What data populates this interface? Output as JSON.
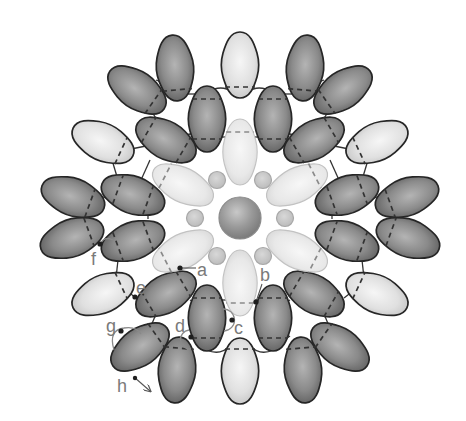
{
  "diagram": {
    "type": "beadwork-pattern",
    "labels": {
      "a": "a",
      "b": "b",
      "c": "c",
      "d": "d",
      "e": "e",
      "f": "f",
      "g": "g",
      "h": "h"
    },
    "colors": {
      "dark_bead_highlight": "#b4b4b4",
      "dark_bead_mid": "#8a8a8a",
      "dark_bead_edge": "#5e5e5e",
      "light_bead_highlight": "#f4f4f4",
      "light_bead_edge": "#c8c8c8",
      "petal_highlight": "#f5f5f5",
      "petal_edge": "#d8d8d8",
      "petal_outline": "#c2c2c2",
      "outline": "#262626",
      "thread": "#333333",
      "label": "#7a7a7a",
      "small_bead": "#c9c9c9",
      "small_bead_outline": "#a8a8a8",
      "center_bead_highlight": "#c4c4c4",
      "center_bead_edge": "#7c7c7c"
    },
    "center_bead": {
      "x": 240,
      "y": 218,
      "r": 21
    },
    "small_beads": [
      {
        "x": 217,
        "y": 180,
        "r": 8.5
      },
      {
        "x": 263,
        "y": 180,
        "r": 8.5
      },
      {
        "x": 195,
        "y": 218,
        "r": 8.5
      },
      {
        "x": 285,
        "y": 218,
        "r": 8.5
      },
      {
        "x": 217,
        "y": 256,
        "r": 8.5
      },
      {
        "x": 263,
        "y": 256,
        "r": 8.5
      }
    ],
    "beads": [
      {
        "t": "light",
        "x": 240,
        "y": 65,
        "r": 0,
        "d": [
          22
        ]
      },
      {
        "t": "dark",
        "x": 175,
        "y": 68,
        "r": -5,
        "d": [
          22
        ]
      },
      {
        "t": "dark",
        "x": 305,
        "y": 68,
        "r": 5,
        "d": [
          22
        ]
      },
      {
        "t": "dark",
        "x": 137,
        "y": 90,
        "r": -55,
        "d": [
          20
        ]
      },
      {
        "t": "dark",
        "x": 343,
        "y": 90,
        "r": 55,
        "d": [
          20
        ]
      },
      {
        "t": "light",
        "x": 103,
        "y": 142,
        "r": -65,
        "d": [
          20
        ]
      },
      {
        "t": "light",
        "x": 377,
        "y": 142,
        "r": 65,
        "d": [
          20
        ]
      },
      {
        "t": "dark",
        "x": 73,
        "y": 197,
        "r": -70,
        "d": [
          18
        ]
      },
      {
        "t": "dark",
        "x": 407,
        "y": 197,
        "r": 70,
        "d": [
          18
        ]
      },
      {
        "t": "dark",
        "x": 72,
        "y": 238,
        "r": 70,
        "d": [
          -18
        ]
      },
      {
        "t": "dark",
        "x": 408,
        "y": 238,
        "r": -70,
        "d": [
          -18
        ]
      },
      {
        "t": "light",
        "x": 103,
        "y": 294,
        "r": 65,
        "d": [
          -20
        ]
      },
      {
        "t": "light",
        "x": 377,
        "y": 294,
        "r": -65,
        "d": [
          -20
        ]
      },
      {
        "t": "dark",
        "x": 140,
        "y": 347,
        "r": 55,
        "d": [
          -20
        ]
      },
      {
        "t": "dark",
        "x": 340,
        "y": 347,
        "r": -55,
        "d": [
          -20
        ]
      },
      {
        "t": "dark",
        "x": 177,
        "y": 370,
        "r": 5,
        "d": [
          -22
        ]
      },
      {
        "t": "dark",
        "x": 303,
        "y": 370,
        "r": -5,
        "d": [
          -22
        ]
      },
      {
        "t": "light",
        "x": 240,
        "y": 371,
        "r": 0,
        "d": [
          -22
        ]
      },
      {
        "t": "dark",
        "x": 207,
        "y": 119,
        "r": 0,
        "d": [
          -20,
          20
        ]
      },
      {
        "t": "dark",
        "x": 273,
        "y": 119,
        "r": 0,
        "d": [
          -20,
          20
        ]
      },
      {
        "t": "dark",
        "x": 166,
        "y": 140,
        "r": -60,
        "d": [
          -20,
          20
        ]
      },
      {
        "t": "dark",
        "x": 314,
        "y": 140,
        "r": 60,
        "d": [
          -20,
          20
        ]
      },
      {
        "t": "dark",
        "x": 133,
        "y": 195,
        "r": -70,
        "d": [
          -16,
          16
        ]
      },
      {
        "t": "dark",
        "x": 347,
        "y": 195,
        "r": 70,
        "d": [
          -16,
          16
        ]
      },
      {
        "t": "dark",
        "x": 133,
        "y": 241,
        "r": 70,
        "d": [
          -16,
          16
        ]
      },
      {
        "t": "dark",
        "x": 347,
        "y": 241,
        "r": -70,
        "d": [
          -16,
          16
        ]
      },
      {
        "t": "dark",
        "x": 166,
        "y": 294,
        "r": 60,
        "d": [
          -20,
          20
        ]
      },
      {
        "t": "dark",
        "x": 314,
        "y": 294,
        "r": -60,
        "d": [
          -20,
          20
        ]
      },
      {
        "t": "dark",
        "x": 207,
        "y": 318,
        "r": 0,
        "d": [
          -20,
          20
        ]
      },
      {
        "t": "dark",
        "x": 273,
        "y": 318,
        "r": 0,
        "d": [
          -20,
          20
        ]
      },
      {
        "t": "petal",
        "x": 240,
        "y": 152,
        "r": 0,
        "d": [
          -20
        ]
      },
      {
        "t": "petal",
        "x": 240,
        "y": 283,
        "r": 180,
        "d": [
          -20
        ]
      },
      {
        "t": "petal",
        "x": 183,
        "y": 185,
        "r": -63,
        "d": [
          -20
        ]
      },
      {
        "t": "petal",
        "x": 297,
        "y": 185,
        "r": 63,
        "d": [
          -20
        ]
      },
      {
        "t": "petal",
        "x": 183,
        "y": 251,
        "r": 243,
        "d": [
          -20
        ]
      },
      {
        "t": "petal",
        "x": 297,
        "y": 251,
        "r": 117,
        "d": [
          -20
        ]
      }
    ]
  }
}
